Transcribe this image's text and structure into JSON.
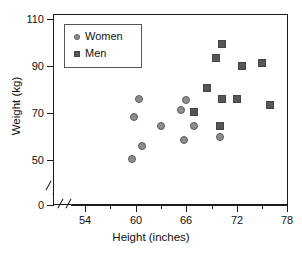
{
  "chart_data": {
    "type": "scatter",
    "title": "",
    "xlabel": "Height (inches)",
    "ylabel": "Weight (kg)",
    "xlim": [
      52,
      78
    ],
    "ylim": [
      45,
      112
    ],
    "grid": false,
    "legend_position": "top-left-inside",
    "axis_breaks": {
      "x": true,
      "y": true
    },
    "x_ticks_major": [
      54,
      60,
      66,
      72,
      78
    ],
    "x_ticks_minor": [
      57,
      63,
      69,
      75
    ],
    "y_ticks": [
      0,
      50,
      70,
      90,
      110
    ],
    "series": [
      {
        "name": "Women",
        "marker": "circle",
        "color": "#8d8d8d",
        "edge_color": "#5a5a5a",
        "points": [
          {
            "x": 59.6,
            "y": 50.5
          },
          {
            "x": 59.8,
            "y": 68.5
          },
          {
            "x": 60.4,
            "y": 76.0
          },
          {
            "x": 60.8,
            "y": 56.0
          },
          {
            "x": 63.0,
            "y": 64.5
          },
          {
            "x": 65.4,
            "y": 71.5
          },
          {
            "x": 65.8,
            "y": 58.5
          },
          {
            "x": 66.0,
            "y": 75.5
          },
          {
            "x": 67.0,
            "y": 64.5
          },
          {
            "x": 70.0,
            "y": 60.0
          }
        ]
      },
      {
        "name": "Men",
        "marker": "square",
        "color": "#565656",
        "edge_color": "#444444",
        "points": [
          {
            "x": 67.0,
            "y": 70.5
          },
          {
            "x": 68.5,
            "y": 80.5
          },
          {
            "x": 69.5,
            "y": 93.5
          },
          {
            "x": 70.3,
            "y": 99.5
          },
          {
            "x": 70.3,
            "y": 76.0
          },
          {
            "x": 70.0,
            "y": 64.5
          },
          {
            "x": 72.0,
            "y": 76.0
          },
          {
            "x": 72.7,
            "y": 90.0
          },
          {
            "x": 75.0,
            "y": 91.5
          },
          {
            "x": 76.0,
            "y": 73.5
          }
        ]
      }
    ]
  },
  "axes": {
    "y_tick_labels": [
      "110",
      "90",
      "70",
      "50",
      "0"
    ],
    "x_tick_labels": [
      "54",
      "60",
      "66",
      "72",
      "78"
    ]
  },
  "legend": {
    "entries": [
      {
        "label": "Women",
        "marker": "circle-marker"
      },
      {
        "label": "Men",
        "marker": "square-marker"
      }
    ]
  }
}
